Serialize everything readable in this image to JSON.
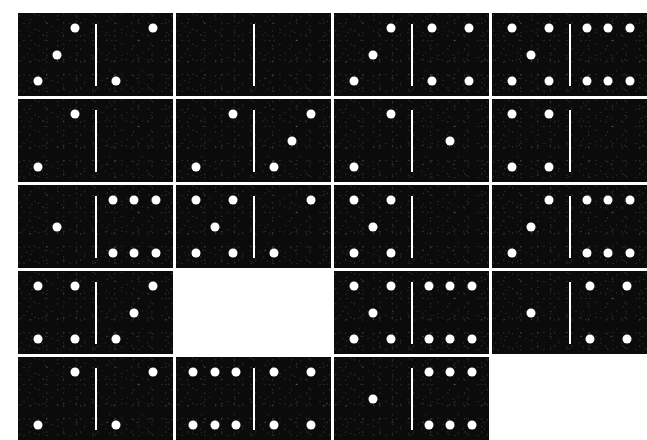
{
  "board": {
    "title": "Domino tile grid",
    "background_color": "#ffffff",
    "tile_color": "#0b0b0b",
    "pip_color": "#ffffff",
    "divider_color": "#ffffff",
    "columns": 4,
    "rows": 5,
    "tile_width": 155,
    "tile_height": 83,
    "gap_x": 3,
    "gap_y": 3,
    "origin_x": 18,
    "origin_y": 13,
    "pip_diameter": 9,
    "divider_height": 62,
    "total_tiles": 18,
    "empty_slots": 2
  },
  "tiles": [
    {
      "id": "tile-r1c1",
      "row": 1,
      "col": 1,
      "left": 3,
      "right": 2,
      "total": 5,
      "empty": false,
      "label": "3-2"
    },
    {
      "id": "tile-r1c2",
      "row": 1,
      "col": 2,
      "left": 0,
      "right": 0,
      "total": 0,
      "empty": false,
      "label": "0-0"
    },
    {
      "id": "tile-r1c3",
      "row": 1,
      "col": 3,
      "left": 3,
      "right": 4,
      "total": 7,
      "empty": false,
      "label": "3-4"
    },
    {
      "id": "tile-r1c4",
      "row": 1,
      "col": 4,
      "left": 5,
      "right": 6,
      "total": 11,
      "empty": false,
      "label": "5-6"
    },
    {
      "id": "tile-r2c1",
      "row": 2,
      "col": 1,
      "left": 2,
      "right": 0,
      "total": 2,
      "empty": false,
      "label": "2-0"
    },
    {
      "id": "tile-r2c2",
      "row": 2,
      "col": 2,
      "left": 2,
      "right": 3,
      "total": 5,
      "empty": false,
      "label": "2-3"
    },
    {
      "id": "tile-r2c3",
      "row": 2,
      "col": 3,
      "left": 2,
      "right": 1,
      "total": 3,
      "empty": false,
      "label": "2-1"
    },
    {
      "id": "tile-r2c4",
      "row": 2,
      "col": 4,
      "left": 4,
      "right": 0,
      "total": 4,
      "empty": false,
      "label": "4-0"
    },
    {
      "id": "tile-r3c1",
      "row": 3,
      "col": 1,
      "left": 1,
      "right": 6,
      "total": 7,
      "empty": false,
      "label": "1-6"
    },
    {
      "id": "tile-r3c2",
      "row": 3,
      "col": 2,
      "left": 5,
      "right": 2,
      "total": 7,
      "empty": false,
      "label": "5-2"
    },
    {
      "id": "tile-r3c3",
      "row": 3,
      "col": 3,
      "left": 5,
      "right": 0,
      "total": 5,
      "empty": false,
      "label": "5-0"
    },
    {
      "id": "tile-r3c4",
      "row": 3,
      "col": 4,
      "left": 3,
      "right": 6,
      "total": 9,
      "empty": false,
      "label": "3-6"
    },
    {
      "id": "tile-r4c1",
      "row": 4,
      "col": 1,
      "left": 4,
      "right": 3,
      "total": 7,
      "empty": false,
      "label": "4-3"
    },
    {
      "id": "tile-r4c2",
      "row": 4,
      "col": 2,
      "left": null,
      "right": null,
      "total": null,
      "empty": true,
      "label": ""
    },
    {
      "id": "tile-r4c3",
      "row": 4,
      "col": 3,
      "left": 5,
      "right": 6,
      "total": 11,
      "empty": false,
      "label": "5-6"
    },
    {
      "id": "tile-r4c4",
      "row": 4,
      "col": 4,
      "left": 1,
      "right": 4,
      "total": 5,
      "empty": false,
      "label": "1-4"
    },
    {
      "id": "tile-r5c1",
      "row": 5,
      "col": 1,
      "left": 2,
      "right": 2,
      "total": 4,
      "empty": false,
      "label": "2-2"
    },
    {
      "id": "tile-r5c2",
      "row": 5,
      "col": 2,
      "left": 6,
      "right": 4,
      "total": 10,
      "empty": false,
      "label": "6-4"
    },
    {
      "id": "tile-r5c3",
      "row": 5,
      "col": 3,
      "left": 1,
      "right": 6,
      "total": 7,
      "empty": false,
      "label": "1-6"
    },
    {
      "id": "tile-r5c4",
      "row": 5,
      "col": 4,
      "left": null,
      "right": null,
      "total": null,
      "empty": true,
      "label": ""
    }
  ],
  "pip_layouts": {
    "0": [],
    "1": [
      [
        50,
        50
      ]
    ],
    "2": [
      [
        74,
        18
      ],
      [
        26,
        82
      ]
    ],
    "3": [
      [
        74,
        18
      ],
      [
        50,
        50
      ],
      [
        26,
        82
      ]
    ],
    "4": [
      [
        26,
        18
      ],
      [
        74,
        18
      ],
      [
        26,
        82
      ],
      [
        74,
        82
      ]
    ],
    "5": [
      [
        26,
        18
      ],
      [
        74,
        18
      ],
      [
        50,
        50
      ],
      [
        26,
        82
      ],
      [
        74,
        82
      ]
    ],
    "6": [
      [
        22,
        18
      ],
      [
        50,
        18
      ],
      [
        78,
        18
      ],
      [
        22,
        82
      ],
      [
        50,
        82
      ],
      [
        78,
        82
      ]
    ]
  }
}
